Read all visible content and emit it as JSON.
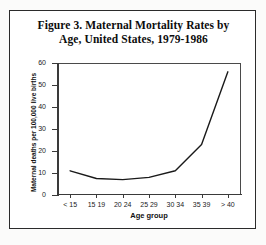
{
  "figure": {
    "title_line1": "Figure 3. Maternal Mortality Rates by",
    "title_line2": "Age, United States, 1979-1986"
  },
  "chart_data": {
    "type": "line",
    "title": "Figure 3. Maternal Mortality Rates by Age, United States, 1979-1986",
    "xlabel": "Age group",
    "ylabel": "Maternal deaths per 100,000 live births",
    "categories": [
      "< 15",
      "15 19",
      "20 24",
      "25 29",
      "30 34",
      "35 39",
      "> 40"
    ],
    "values": [
      11,
      7.5,
      7,
      8,
      11,
      23,
      56
    ],
    "ylim": [
      0,
      60
    ],
    "yticks": [
      0,
      10,
      20,
      30,
      40,
      50,
      60
    ],
    "ytick_labels": [
      "0",
      "10",
      "20",
      "30",
      "40",
      "50",
      "60"
    ],
    "grid": false,
    "legend": "none",
    "line_color": "#1a1a1a"
  }
}
